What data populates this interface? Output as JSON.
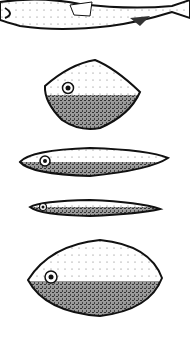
{
  "illustration": {
    "description": "Fish and lure body shapes, top fish partially cropped, four lure profiles below",
    "colors": {
      "outline": "#111111",
      "belly_fill": "#9a9a9a",
      "back_fill": "#ffffff",
      "eye": "#111111"
    },
    "shapes": [
      {
        "name": "fish-top",
        "kind": "fish"
      },
      {
        "name": "lure-diamond",
        "kind": "lure"
      },
      {
        "name": "lure-long",
        "kind": "lure"
      },
      {
        "name": "lure-slim",
        "kind": "lure"
      },
      {
        "name": "lure-oval",
        "kind": "lure"
      }
    ]
  }
}
